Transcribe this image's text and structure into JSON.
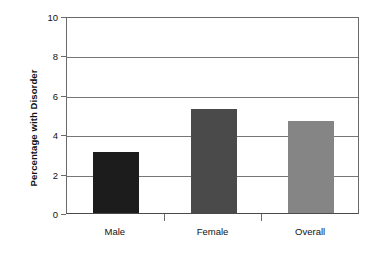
{
  "chart_data": {
    "type": "bar",
    "title": "",
    "xlabel": "",
    "ylabel": "Percentage with Disorder",
    "categories": [
      "Male",
      "Female",
      "Overall"
    ],
    "values": [
      3.1,
      5.3,
      4.65
    ],
    "series": [
      {
        "name": "Percentage with Disorder",
        "values": [
          3.1,
          5.3,
          4.65
        ]
      }
    ],
    "ylim": [
      0,
      10
    ],
    "ytick_labels": [
      "0",
      "2",
      "4",
      "6",
      "8",
      "10"
    ],
    "ytick_values": [
      0,
      2,
      4,
      6,
      8,
      10
    ],
    "grid": "horizontal",
    "legend": "none",
    "bar_colors": [
      "#1c1c1c",
      "#4a4a4a",
      "#858585"
    ],
    "background_color": "#ffffff",
    "axis_color": "#6a6a6a",
    "gridline_color": "#767676"
  },
  "axes": {
    "y_title": "Percentage with Disorder"
  }
}
